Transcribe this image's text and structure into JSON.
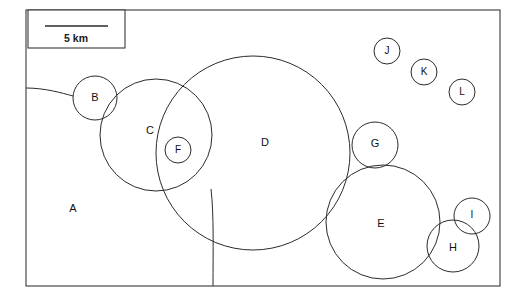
{
  "figure": {
    "title": "",
    "background_color": "#ffffff",
    "stroke_color": "#2b2b2b",
    "frame_color": "#3a3a3a",
    "width": 525,
    "height": 302
  },
  "scale_bar": {
    "label": "5 km",
    "box": {
      "x": 28,
      "y": 10,
      "width": 97,
      "height": 38
    },
    "bar": {
      "x1": 45,
      "x2": 108,
      "y": 26
    }
  },
  "frame": {
    "x": 26,
    "y": 10,
    "width": 474,
    "height": 276
  },
  "regions": [
    {
      "id": "A",
      "label": "A",
      "label_x": 73,
      "label_y": 209,
      "kind": "mainland"
    },
    {
      "id": "B",
      "label": "B",
      "label_x": 95,
      "label_y": 98,
      "kind": "circle",
      "cx": 95,
      "cy": 98,
      "r": 22
    },
    {
      "id": "C",
      "label": "C",
      "label_x": 150,
      "label_y": 131,
      "kind": "circle",
      "cx": 156,
      "cy": 135,
      "r": 56
    },
    {
      "id": "D",
      "label": "D",
      "label_x": 265,
      "label_y": 143,
      "kind": "circle",
      "cx": 253,
      "cy": 153,
      "r": 97
    },
    {
      "id": "E",
      "label": "E",
      "label_x": 381,
      "label_y": 224,
      "kind": "circle",
      "cx": 383,
      "cy": 222,
      "r": 57
    },
    {
      "id": "F",
      "label": "F",
      "label_x": 178,
      "label_y": 150,
      "kind": "circle",
      "cx": 178,
      "cy": 150,
      "r": 13
    },
    {
      "id": "G",
      "label": "G",
      "label_x": 375,
      "label_y": 144,
      "kind": "circle",
      "cx": 375,
      "cy": 145,
      "r": 23
    },
    {
      "id": "H",
      "label": "H",
      "label_x": 453,
      "label_y": 248,
      "kind": "circle",
      "cx": 453,
      "cy": 246,
      "r": 26
    },
    {
      "id": "I",
      "label": "I",
      "label_x": 472,
      "label_y": 215,
      "kind": "circle",
      "cx": 472,
      "cy": 216,
      "r": 18
    },
    {
      "id": "J",
      "label": "J",
      "label_x": 387,
      "label_y": 51,
      "kind": "circle",
      "cx": 387,
      "cy": 51,
      "r": 13
    },
    {
      "id": "K",
      "label": "K",
      "label_x": 424,
      "label_y": 72,
      "kind": "circle",
      "cx": 424,
      "cy": 72,
      "r": 13
    },
    {
      "id": "L",
      "label": "L",
      "label_x": 462,
      "label_y": 92,
      "kind": "circle",
      "cx": 462,
      "cy": 92,
      "r": 13
    }
  ],
  "boundaries": [
    {
      "name": "coastline-west",
      "path": "M 26 88 C 45 88, 62 93, 73 96"
    },
    {
      "name": "coastline-south",
      "path": "M 211 189 C 214 215, 213 250, 213 286"
    }
  ]
}
